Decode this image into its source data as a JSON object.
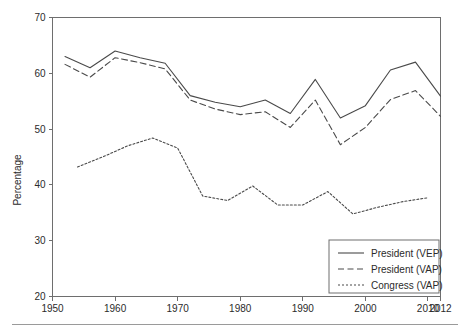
{
  "figure": {
    "background": "#ffffff",
    "ink_color": "#4a4a4a",
    "axis_color": "#6e6e6e"
  },
  "chart_data": {
    "type": "line",
    "title": "",
    "subtitle": "",
    "xlabel": "",
    "ylabel": "Percentage",
    "xlim": [
      1950,
      2012
    ],
    "ylim": [
      20,
      70
    ],
    "grid": false,
    "legend_position": "bottom-right",
    "x_ticks": [
      1950,
      1960,
      1970,
      1980,
      1990,
      2000,
      2010,
      2012
    ],
    "x_tick_labels": [
      "1950",
      "1960",
      "1970",
      "1980",
      "1990",
      "2000",
      "2010",
      "2012"
    ],
    "y_ticks": [
      20,
      30,
      40,
      50,
      60,
      70
    ],
    "y_tick_labels": [
      "20",
      "30",
      "40",
      "50",
      "60",
      "70"
    ],
    "series": [
      {
        "name": "President (VEP)",
        "style": "solid",
        "x": [
          1952,
          1956,
          1960,
          1964,
          1968,
          1972,
          1976,
          1980,
          1984,
          1988,
          1992,
          1996,
          2000,
          2004,
          2008,
          2012
        ],
        "values": [
          63.0,
          61.0,
          64.0,
          62.8,
          61.8,
          56.0,
          54.8,
          54.0,
          55.2,
          52.8,
          58.9,
          52.0,
          54.2,
          60.6,
          62.0,
          55.9
        ]
      },
      {
        "name": "President (VAP)",
        "style": "dashed",
        "x": [
          1952,
          1956,
          1960,
          1964,
          1968,
          1972,
          1976,
          1980,
          1984,
          1988,
          1992,
          1996,
          2000,
          2004,
          2008,
          2012
        ],
        "values": [
          61.6,
          59.3,
          62.8,
          61.9,
          60.8,
          55.2,
          53.6,
          52.6,
          53.1,
          50.3,
          55.2,
          47.2,
          50.3,
          55.3,
          56.9,
          52.3
        ]
      },
      {
        "name": "Congress (VAP)",
        "style": "dotted",
        "x": [
          1954,
          1958,
          1962,
          1966,
          1970,
          1974,
          1978,
          1982,
          1986,
          1990,
          1994,
          1998,
          2002,
          2006,
          2010
        ],
        "values": [
          43.2,
          45.0,
          47.0,
          48.4,
          46.6,
          38.0,
          37.2,
          39.8,
          36.4,
          36.4,
          38.8,
          34.8,
          36.0,
          37.0,
          37.7
        ]
      }
    ]
  },
  "legend": {
    "entries": [
      {
        "label": "President (VEP)",
        "style": "solid"
      },
      {
        "label": "President (VAP)",
        "style": "dashed"
      },
      {
        "label": "Congress (VAP)",
        "style": "dotted"
      }
    ]
  },
  "axis": {
    "y_title": "Percentage"
  }
}
